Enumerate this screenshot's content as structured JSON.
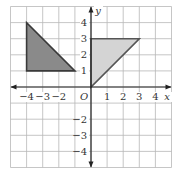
{
  "diagram": {
    "type": "coordinate-plane",
    "grid": {
      "xmin": -5,
      "xmax": 5,
      "ymin": -5,
      "ymax": 5,
      "step": 1
    },
    "axes": {
      "x_label": "x",
      "y_label": "y",
      "origin_label": "O"
    },
    "x_ticks": [
      {
        "value": -4,
        "label": "−4"
      },
      {
        "value": -3,
        "label": "−3"
      },
      {
        "value": -2,
        "label": "−2"
      },
      {
        "value": 1,
        "label": "1"
      },
      {
        "value": 2,
        "label": "2"
      },
      {
        "value": 3,
        "label": "3"
      },
      {
        "value": 4,
        "label": "4"
      }
    ],
    "y_ticks": [
      {
        "value": 4,
        "label": "4"
      },
      {
        "value": 3,
        "label": "3"
      },
      {
        "value": 2,
        "label": "2"
      },
      {
        "value": 1,
        "label": "1"
      },
      {
        "value": -2,
        "label": "−2"
      },
      {
        "value": -3,
        "label": "−3"
      },
      {
        "value": -4,
        "label": "−4"
      }
    ],
    "shapes": [
      {
        "name": "dark-triangle",
        "vertices": [
          [
            -4,
            4
          ],
          [
            -4,
            1
          ],
          [
            -1,
            1
          ]
        ],
        "fill": "#8a8a8a",
        "stroke": "#3a3a3a"
      },
      {
        "name": "light-triangle",
        "vertices": [
          [
            0,
            0
          ],
          [
            0,
            3
          ],
          [
            3,
            3
          ]
        ],
        "fill": "#d4d4d4",
        "stroke": "#555555"
      }
    ],
    "colors": {
      "grid": "#b8b8b8",
      "axis": "#222222",
      "background": "#ffffff"
    }
  }
}
